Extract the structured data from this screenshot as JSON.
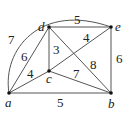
{
  "graph": {
    "nodes": [
      {
        "id": "a",
        "label": "a"
      },
      {
        "id": "b",
        "label": "b"
      },
      {
        "id": "c",
        "label": "c"
      },
      {
        "id": "d",
        "label": "d"
      },
      {
        "id": "e",
        "label": "e"
      }
    ],
    "edges": [
      {
        "from": "a",
        "to": "e",
        "weight": "7",
        "curved": true
      },
      {
        "from": "a",
        "to": "d",
        "weight": "6"
      },
      {
        "from": "a",
        "to": "c",
        "weight": "4"
      },
      {
        "from": "a",
        "to": "b",
        "weight": "5"
      },
      {
        "from": "d",
        "to": "e",
        "weight": "5"
      },
      {
        "from": "d",
        "to": "c",
        "weight": "3"
      },
      {
        "from": "c",
        "to": "e",
        "weight": "4"
      },
      {
        "from": "d",
        "to": "b",
        "weight": "8"
      },
      {
        "from": "c",
        "to": "b",
        "weight": "7"
      },
      {
        "from": "e",
        "to": "b",
        "weight": "6"
      }
    ]
  }
}
